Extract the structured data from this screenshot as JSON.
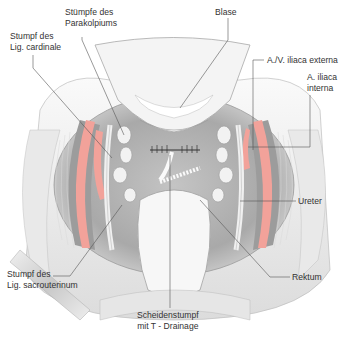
{
  "figure": {
    "type": "anatomical-surgical-illustration",
    "colors": {
      "artery": "#f2a29a",
      "tissue_gray": "#b8b8b8",
      "dark_gray": "#8f8f8f",
      "light_tissue": "#e6e6e6",
      "leader_line": "#555555",
      "text": "#333333"
    }
  },
  "labels": {
    "stuempfe_parakolpium": {
      "line1": "Stümpfe des",
      "line2": "Parakolpiums"
    },
    "blase": {
      "line1": "Blase"
    },
    "stumpf_cardinale": {
      "line1": "Stumpf des",
      "line2": "Lig. cardinale"
    },
    "iliaca_externa": {
      "line1": "A./V. iliaca externa"
    },
    "iliaca_interna": {
      "line1": "A. iliaca",
      "line2": "interna"
    },
    "ureter": {
      "line1": "Ureter"
    },
    "rektum": {
      "line1": "Rektum"
    },
    "stumpf_sacrouterinum": {
      "line1": "Stumpf des",
      "line2": "Lig. sacrouterinum"
    },
    "scheidenstumpf": {
      "line1": "Scheidenstumpf",
      "line2": "mit T - Drainage"
    }
  }
}
